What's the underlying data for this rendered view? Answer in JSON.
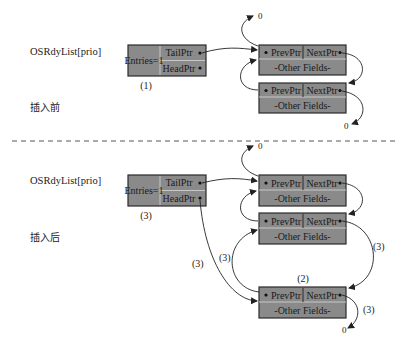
{
  "colors": {
    "box_fill": "#8a8a8a",
    "box_stroke": "#2a2a2a",
    "divider": "#c8c8c8",
    "line": "#222222",
    "dash": "#444444"
  },
  "before": {
    "list_label": "OSRdyList[prio]",
    "entries": "Entries=1",
    "tail_ptr": "TailPtr",
    "head_ptr": "HeadPtr",
    "step": "(1)",
    "caption": "插入前",
    "nodes": [
      {
        "prev": "PrevPtr",
        "next": "NextPtr",
        "fields": "-Other Fields-"
      },
      {
        "prev": "PrevPtr",
        "next": "NextPtr",
        "fields": "-Other Fields-"
      }
    ],
    "null_top": "0",
    "null_bottom": "0"
  },
  "after": {
    "list_label": "OSRdyList[prio]",
    "entries": "Entries=1",
    "tail_ptr": "TailPtr",
    "head_ptr": "HeadPtr",
    "step_list": "(3)",
    "caption": "插入后",
    "nodes": [
      {
        "prev": "PrevPtr",
        "next": "NextPtr",
        "fields": "-Other Fields-"
      },
      {
        "prev": "PrevPtr",
        "next": "NextPtr",
        "fields": "-Other Fields-"
      },
      {
        "prev": "PrevPtr",
        "next": "NextPtr",
        "fields": "-Other Fields-",
        "step": "(2)"
      }
    ],
    "step_head_arrow": "(3)",
    "step_prev_arrow": "(3)",
    "step_next_arrow": "(3)",
    "step_null_arrow": "(3)",
    "null_top": "0",
    "null_bottom": "0"
  }
}
